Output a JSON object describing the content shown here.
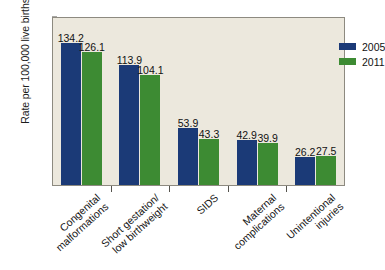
{
  "chart_data": {
    "type": "bar",
    "title": "",
    "xlabel": "",
    "ylabel": "Rate per 100,000 live births",
    "ylim": [
      0,
      160
    ],
    "yticks": [
      0,
      20,
      40,
      60,
      80,
      100,
      120,
      140,
      160
    ],
    "grid": false,
    "legend_position": "top-right",
    "categories": [
      "Congenital malformations",
      "Short gestation/ low birthweight",
      "SIDS",
      "Maternal complications",
      "Unintentional injuries"
    ],
    "category_lines": [
      [
        "Congenital",
        "malformations"
      ],
      [
        "Short gestation/",
        "low birthweight"
      ],
      [
        "SIDS",
        ""
      ],
      [
        "Maternal",
        "complications"
      ],
      [
        "Unintentional",
        "injuries"
      ]
    ],
    "series": [
      {
        "name": "2005",
        "color": "#1b3a77",
        "values": [
          134.2,
          113.9,
          53.9,
          42.9,
          26.2
        ]
      },
      {
        "name": "2011",
        "color": "#3d8b33",
        "values": [
          126.1,
          104.1,
          43.3,
          39.9,
          27.5
        ]
      }
    ]
  },
  "colors": {
    "series_2005": "#1b3a77",
    "series_2011": "#3d8b33",
    "plot_background": "#ece8dd",
    "page_background": "#ffffff",
    "axis": "#55534d"
  }
}
